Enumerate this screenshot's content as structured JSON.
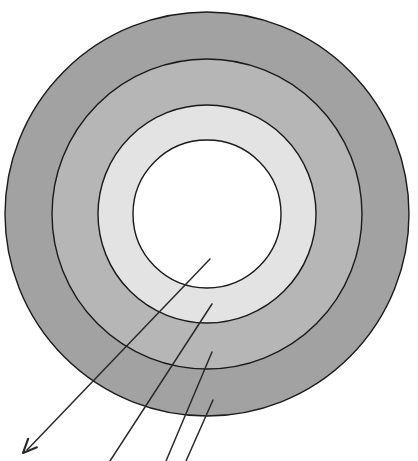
{
  "figure": {
    "type": "diagram",
    "background_color": "#ffffff",
    "width": 418,
    "height": 461
  },
  "geometry": {
    "center_x": 207,
    "center_y": 214,
    "stroke_color": "#1a1a1a",
    "stroke_width": 1.4
  },
  "rings": [
    {
      "name": "outer-ring",
      "label": "",
      "radius": 202,
      "fill": "#a2a2a2",
      "stroke": "#1a1a1a"
    },
    {
      "name": "second-ring",
      "label": "",
      "radius": 155,
      "fill": "#b6b6b6",
      "stroke": "#1a1a1a"
    },
    {
      "name": "third-ring",
      "label": "",
      "radius": 109,
      "fill": "#e3e3e3",
      "stroke": "#1a1a1a"
    },
    {
      "name": "core",
      "label": "",
      "radius": 74,
      "fill": "#ffffff",
      "stroke": "#1a1a1a"
    }
  ],
  "leader_lines": [
    {
      "name": "leader-line-core",
      "label": "",
      "x1": 210,
      "y1": 259,
      "x2": 27,
      "y2": 450,
      "arrowhead": true,
      "stroke": "#2a2a2a",
      "stroke_width": 1.5
    },
    {
      "name": "leader-line-third-ring",
      "label": "",
      "x1": 212,
      "y1": 304,
      "x2": 110,
      "y2": 461,
      "arrowhead": false,
      "stroke": "#2a2a2a",
      "stroke_width": 1.5
    },
    {
      "name": "leader-line-second-ring",
      "label": "",
      "x1": 212,
      "y1": 352,
      "x2": 166,
      "y2": 461,
      "arrowhead": false,
      "stroke": "#2a2a2a",
      "stroke_width": 1.5
    },
    {
      "name": "leader-line-outer-ring",
      "label": "",
      "x1": 213,
      "y1": 400,
      "x2": 186,
      "y2": 461,
      "arrowhead": false,
      "stroke": "#2a2a2a",
      "stroke_width": 1.5
    }
  ],
  "arrowhead": {
    "tip_x": 23,
    "tip_y": 453,
    "size": 15,
    "color": "#2a2a2a"
  },
  "chart_data": {
    "type": "pie",
    "title": "",
    "xlabel": "",
    "ylabel": "",
    "categories": [
      "outer-ring",
      "second-ring",
      "third-ring",
      "core"
    ],
    "values": [
      202,
      155,
      109,
      74
    ],
    "value_unit": "px radius",
    "colors": [
      "#a2a2a2",
      "#b6b6b6",
      "#e3e3e3",
      "#ffffff"
    ],
    "legend_position": "none",
    "grid": false,
    "annotations": [
      "leader-line-core",
      "leader-line-third-ring",
      "leader-line-second-ring",
      "leader-line-outer-ring"
    ]
  }
}
